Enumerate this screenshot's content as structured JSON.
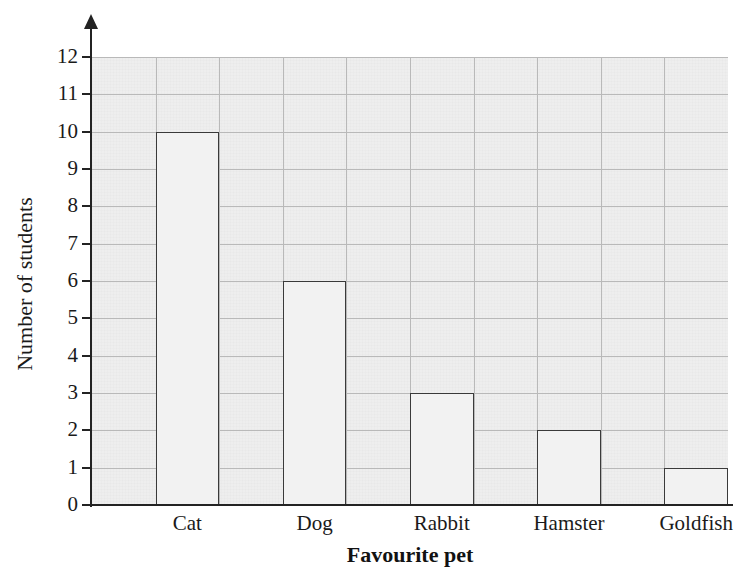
{
  "chart_data": {
    "type": "bar",
    "title": "",
    "xlabel": "Favourite pet",
    "ylabel": "Number of students",
    "categories": [
      "Cat",
      "Dog",
      "Rabbit",
      "Hamster",
      "Goldfish"
    ],
    "values": [
      10,
      6,
      3,
      2,
      1
    ],
    "ylim": [
      0,
      12
    ],
    "y_ticks": [
      0,
      1,
      2,
      3,
      4,
      5,
      6,
      7,
      8,
      9,
      10,
      11,
      12
    ],
    "y_tick_labels": [
      "0",
      "1",
      "2",
      "3",
      "4",
      "5",
      "6",
      "7",
      "8",
      "9",
      "10",
      "11",
      "12"
    ],
    "grid": true,
    "legend": false,
    "legend_position": "none",
    "bar_fill_color": "#f2f2f2",
    "bar_edge_color": "#3a3a3a",
    "plot_background_color": "#eeeeee",
    "gridline_color": "#b9b9b9",
    "axis_color": "#232323",
    "y_axis_has_arrow": true
  }
}
